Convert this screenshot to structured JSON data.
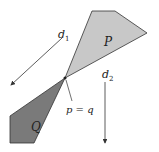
{
  "diagram": {
    "polygons": [
      {
        "id": "P",
        "label": "P",
        "fill": "#c8c8c8",
        "points": "92,11 115,11 147,33 65,78",
        "label_pos": [
          104,
          46
        ]
      },
      {
        "id": "Q",
        "label": "Q",
        "fill": "#7a7a7a",
        "points": "65,78 10,116 10,143 34,143",
        "label_pos": [
          31,
          131
        ]
      }
    ],
    "arrows": [
      {
        "id": "d1",
        "label": "d",
        "sub": "1",
        "from": [
          62,
          38
        ],
        "to": [
          11,
          85
        ],
        "label_pos": [
          58,
          38
        ]
      },
      {
        "id": "d2",
        "label": "d",
        "sub": "2",
        "from": [
          105,
          82
        ],
        "to": [
          105,
          143
        ],
        "label_pos": [
          102,
          78
        ]
      }
    ],
    "point": {
      "label": "p = q",
      "pos": [
        65,
        78
      ],
      "label_pos": [
        66,
        113
      ],
      "pointer_from": [
        72,
        101
      ],
      "pointer_to": [
        66,
        80
      ]
    },
    "stroke_color": "#333333"
  }
}
